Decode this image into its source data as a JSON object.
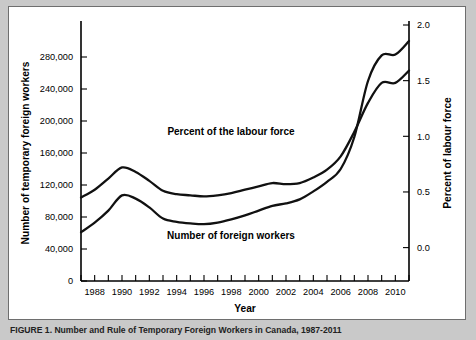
{
  "figure": {
    "caption": "FIGURE 1. Number and Rule of Temporary Foreign Workers in Canada, 1987-2011",
    "background_color": "#c9c9c9",
    "panel_color": "#ffffff",
    "line_color": "#111111"
  },
  "chart_data": {
    "type": "line",
    "title": "",
    "xlabel": "Year",
    "ylabel": "Number of temporary foreign workers",
    "y2label": "Percent of labour force",
    "grid": false,
    "legend_position": "inline-annotations",
    "xlim": [
      1987,
      2011
    ],
    "ylim": [
      0,
      320000
    ],
    "y2lim": [
      -0.3,
      2.0
    ],
    "x": [
      1987,
      1988,
      1989,
      1990,
      1991,
      1992,
      1993,
      1994,
      1995,
      1996,
      1997,
      1998,
      1999,
      2000,
      2001,
      2002,
      2003,
      2004,
      2005,
      2006,
      2007,
      2008,
      2009,
      2010,
      2011
    ],
    "xticks": [
      1987,
      1988,
      1989,
      1990,
      1991,
      1992,
      1993,
      1994,
      1995,
      1996,
      1997,
      1998,
      1999,
      2000,
      2001,
      2002,
      2003,
      2004,
      2005,
      2006,
      2007,
      2008,
      2009,
      2010,
      2011
    ],
    "xtick_labels": [
      "",
      "1988",
      "",
      "1990",
      "",
      "1992",
      "",
      "1994",
      "",
      "1996",
      "",
      "1998",
      "",
      "2000",
      "",
      "2002",
      "",
      "2004",
      "",
      "2006",
      "",
      "2008",
      "",
      "2010",
      ""
    ],
    "yticks": [
      0,
      40000,
      80000,
      120000,
      160000,
      200000,
      240000,
      280000
    ],
    "ytick_labels": [
      "0",
      "40,000",
      "80,000",
      "120,000",
      "160,000",
      "200,000",
      "240,000",
      "280,000"
    ],
    "y2ticks": [
      0.0,
      0.5,
      1.0,
      1.5,
      2.0
    ],
    "y2tick_labels": [
      "0.0",
      "0.5",
      "1.0",
      "1.5",
      "2.0"
    ],
    "series": [
      {
        "name": "Percent of the labour force",
        "axis": "right",
        "annotation": "Percent of the labour force",
        "values": [
          0.45,
          0.52,
          0.62,
          0.72,
          0.68,
          0.6,
          0.51,
          0.48,
          0.47,
          0.46,
          0.47,
          0.49,
          0.52,
          0.55,
          0.58,
          0.57,
          0.58,
          0.63,
          0.7,
          0.82,
          1.04,
          1.3,
          1.48,
          1.48,
          1.59
        ]
      },
      {
        "name": "Number of foreign workers",
        "axis": "left",
        "annotation": "Number of foreign workers",
        "values": [
          61000,
          73000,
          88000,
          107000,
          103000,
          92000,
          78000,
          74000,
          72000,
          71000,
          73000,
          77000,
          82000,
          88000,
          94000,
          97000,
          102000,
          112000,
          124000,
          140000,
          180000,
          250000,
          282000,
          283000,
          300000
        ]
      }
    ]
  }
}
